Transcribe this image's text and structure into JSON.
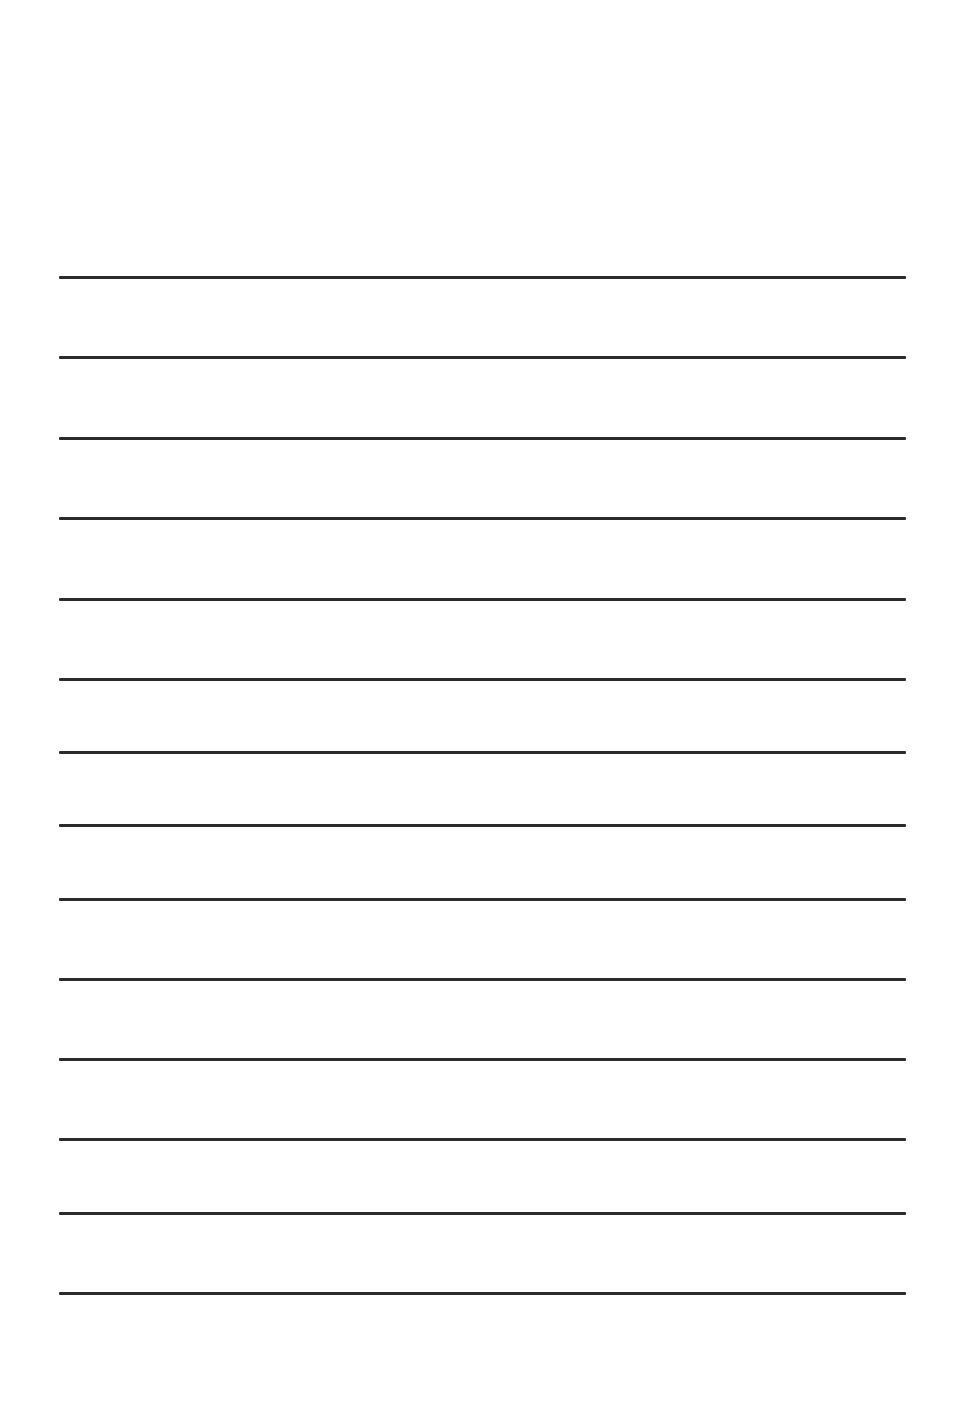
{
  "document": {
    "type": "lined-paper",
    "background_color": "#ffffff",
    "line_color": "#2b2b2b",
    "line_thickness_px": 3,
    "line_left_px": 59,
    "line_right_px": 906,
    "line_count": 14,
    "lines_y_px": [
      277,
      357,
      438,
      518,
      599,
      679,
      752,
      825,
      899,
      979,
      1059,
      1139,
      1213,
      1293
    ]
  }
}
